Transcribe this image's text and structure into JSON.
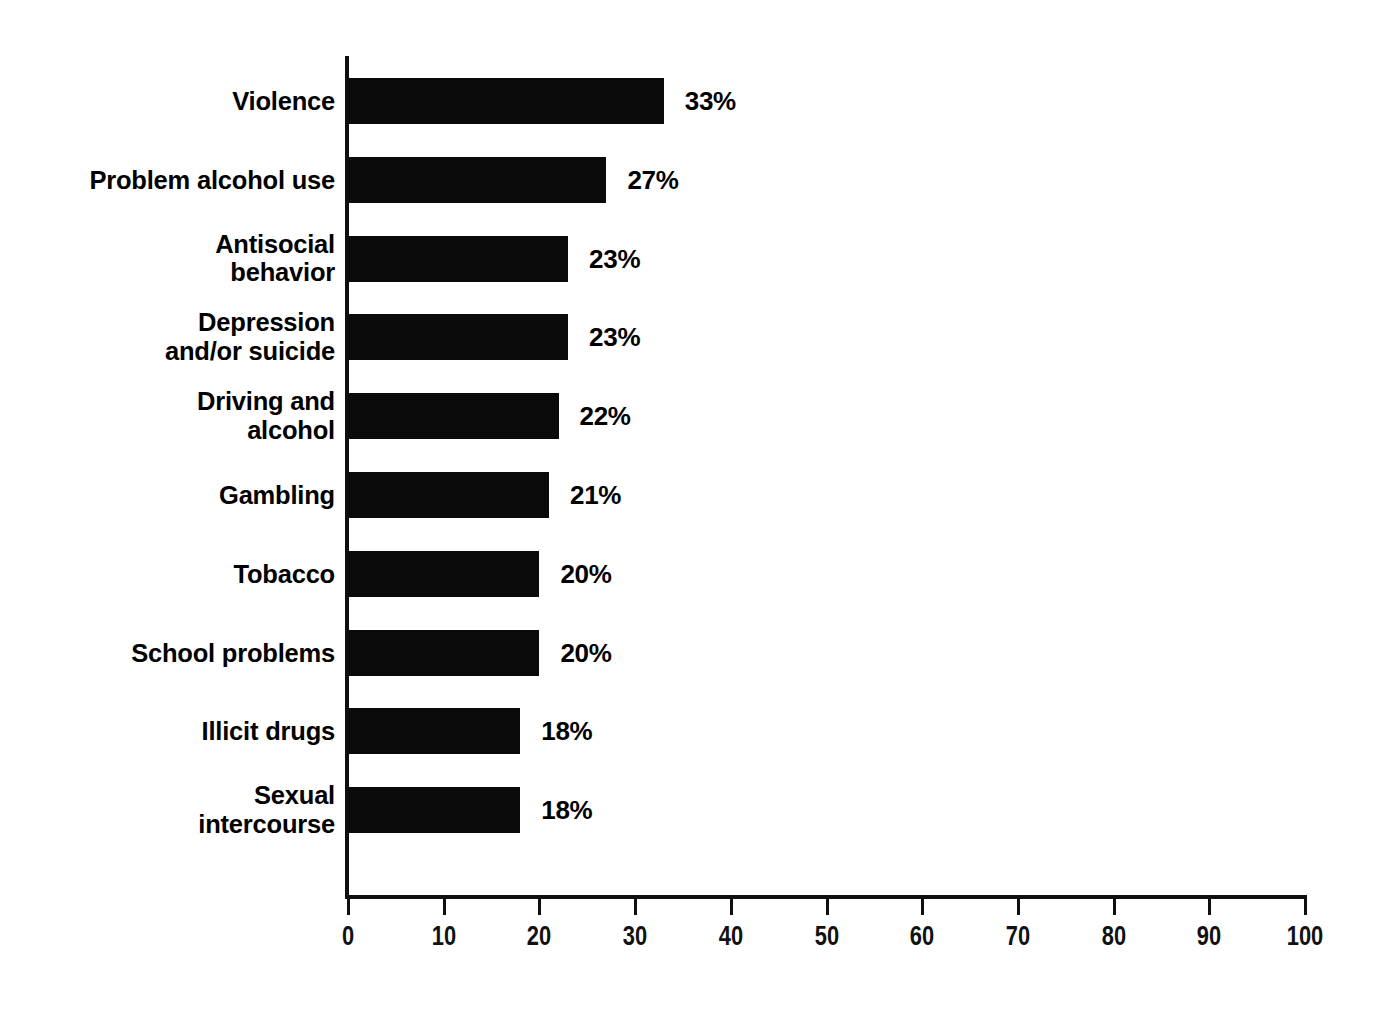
{
  "chart_data": {
    "type": "bar",
    "orientation": "horizontal",
    "title": "",
    "subtitle": "",
    "xlabel": "",
    "ylabel": "",
    "xlim": [
      0,
      100
    ],
    "xticks": [
      0,
      10,
      20,
      30,
      40,
      50,
      60,
      70,
      80,
      90,
      100
    ],
    "xtick_labels": [
      "0",
      "10",
      "20",
      "30",
      "40",
      "50",
      "60",
      "70",
      "80",
      "90",
      "100"
    ],
    "grid": false,
    "legend": null,
    "value_label_suffix": "%",
    "bar_color": "#0a0a0a",
    "text_color": "#000000",
    "axis_color": "#0f0f0f",
    "categories": [
      "Violence",
      "Problem alcohol use",
      "Antisocial\nbehavior",
      "Depression\nand/or suicide",
      "Driving and\nalcohol",
      "Gambling",
      "Tobacco",
      "School problems",
      "Illicit drugs",
      "Sexual\nintercourse"
    ],
    "values": [
      33,
      27,
      23,
      23,
      22,
      21,
      20,
      20,
      18,
      18
    ],
    "data_labels": [
      "33%",
      "27%",
      "23%",
      "23%",
      "22%",
      "21%",
      "20%",
      "20%",
      "18%",
      "18%"
    ],
    "bars": [
      {
        "category": "Violence",
        "value": 33,
        "label": "33%"
      },
      {
        "category": "Problem alcohol use",
        "value": 27,
        "label": "27%"
      },
      {
        "category": "Antisocial behavior",
        "value": 23,
        "label": "23%"
      },
      {
        "category": "Depression and/or suicide",
        "value": 23,
        "label": "23%"
      },
      {
        "category": "Driving and alcohol",
        "value": 22,
        "label": "22%"
      },
      {
        "category": "Gambling",
        "value": 21,
        "label": "21%"
      },
      {
        "category": "Tobacco",
        "value": 20,
        "label": "20%"
      },
      {
        "category": "School problems",
        "value": 20,
        "label": "20%"
      },
      {
        "category": "Illicit drugs",
        "value": 18,
        "label": "18%"
      },
      {
        "category": "Sexual intercourse",
        "value": 18,
        "label": "18%"
      }
    ]
  }
}
